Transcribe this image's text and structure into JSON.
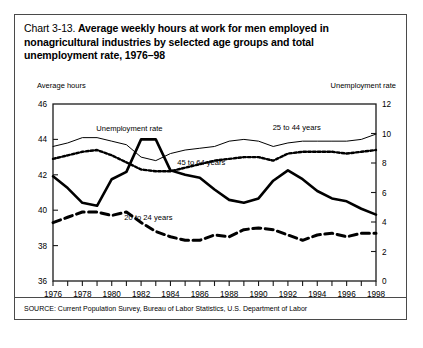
{
  "figure": {
    "chart_number": "Chart 3-13.",
    "title": "Average weekly hours at work for men employed in nonagricultural industries by selected age groups and total unemployment  rate, 1976–98",
    "left_axis_label": "Average hours",
    "right_axis_label": "Unemployment rate",
    "source": "SOURCE: Current Population Survey, Bureau of Labor Statistics, U.S. Department of Labor",
    "border_color": "#4a4a4a"
  },
  "chart_data": {
    "type": "line",
    "xlabel": "",
    "ylabel": "Average hours",
    "y2label": "Unemployment rate",
    "grid": false,
    "legend": "in-plot labels",
    "x": [
      1976,
      1977,
      1978,
      1979,
      1980,
      1981,
      1982,
      1983,
      1984,
      1985,
      1986,
      1987,
      1988,
      1989,
      1990,
      1991,
      1992,
      1993,
      1994,
      1995,
      1996,
      1997,
      1998
    ],
    "xlim": [
      1976,
      1998
    ],
    "xticks_major": [
      "1976",
      "1978",
      "1980",
      "1982",
      "1984",
      "1986",
      "1988",
      "1990",
      "1992",
      "1994",
      "1996",
      "1998"
    ],
    "ylim": [
      36,
      46
    ],
    "yticks": [
      "36",
      "38",
      "40",
      "42",
      "44",
      "46"
    ],
    "y2lim": [
      0,
      12
    ],
    "y2ticks": [
      "0",
      "2",
      "4",
      "6",
      "8",
      "10",
      "12"
    ],
    "series": [
      {
        "name": "25 to 44 years",
        "label": "25 to 44 years",
        "axis": "left",
        "style": "thin-solid",
        "color": "#000000",
        "width": 1,
        "values": [
          43.6,
          43.8,
          44.1,
          44.1,
          43.9,
          43.7,
          43.0,
          42.8,
          43.2,
          43.4,
          43.5,
          43.6,
          43.9,
          44.0,
          43.9,
          43.6,
          43.8,
          43.9,
          43.9,
          43.9,
          43.9,
          44.0,
          44.3
        ]
      },
      {
        "name": "45 to 64 years",
        "label": "45 to 64 years",
        "axis": "left",
        "style": "dotted",
        "color": "#000000",
        "width": 2.4,
        "values": [
          42.9,
          43.1,
          43.3,
          43.4,
          43.1,
          42.7,
          42.3,
          42.2,
          42.2,
          42.4,
          42.6,
          42.8,
          42.9,
          43.0,
          43.0,
          42.8,
          43.2,
          43.3,
          43.3,
          43.3,
          43.2,
          43.3,
          43.4
        ]
      },
      {
        "name": "20 to 24 years",
        "label": "20 to 24 years",
        "axis": "left",
        "style": "dashed",
        "color": "#000000",
        "width": 3.0,
        "values": [
          39.3,
          39.6,
          39.9,
          39.9,
          39.7,
          39.9,
          39.3,
          38.8,
          38.5,
          38.3,
          38.3,
          38.6,
          38.5,
          38.9,
          39.0,
          38.9,
          38.6,
          38.3,
          38.6,
          38.7,
          38.5,
          38.7,
          38.7
        ]
      },
      {
        "name": "Unemployment rate",
        "label": "Unemployment rate",
        "axis": "right",
        "style": "thick-solid",
        "color": "#000000",
        "width": 2.6,
        "values": [
          7.1,
          6.3,
          5.3,
          5.1,
          6.9,
          7.4,
          9.6,
          9.6,
          7.5,
          7.2,
          7.0,
          6.2,
          5.5,
          5.3,
          5.6,
          6.8,
          7.5,
          6.9,
          6.1,
          5.6,
          5.4,
          4.9,
          4.5
        ]
      }
    ],
    "annotations": [
      {
        "text": "Unemployment rate",
        "x": 1981.2,
        "y_left": 44.5
      },
      {
        "text": "25 to 44 years",
        "x": 1992.6,
        "y_left": 44.55
      },
      {
        "text": "45 to 64 years",
        "x": 1986.1,
        "y_left": 42.55
      },
      {
        "text": "20 to 24 years",
        "x": 1982.5,
        "y_left": 39.45
      }
    ]
  }
}
